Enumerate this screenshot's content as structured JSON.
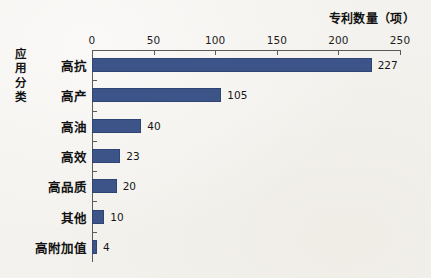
{
  "chart_data": {
    "type": "bar",
    "orientation": "horizontal",
    "title": "",
    "xlabel": "专利数量（项）",
    "ylabel": "应用分类",
    "categories": [
      "高抗",
      "高产",
      "高油",
      "高效",
      "高品质",
      "其他",
      "高附加值"
    ],
    "values": [
      227,
      105,
      40,
      23,
      20,
      10,
      4
    ],
    "value_labels": [
      "227",
      "105",
      "40",
      "23",
      "20",
      "10",
      "4"
    ],
    "xlim": [
      0,
      250
    ],
    "xticks": [
      0,
      50,
      100,
      150,
      200,
      250
    ],
    "xtick_labels": [
      "0",
      "50",
      "100",
      "150",
      "200",
      "250"
    ],
    "grid": false,
    "legend": null,
    "series_color": "#3c5488",
    "axis_color": "#5a5a5a",
    "background_color": "#f4f2ee",
    "text_color": "#121212"
  }
}
